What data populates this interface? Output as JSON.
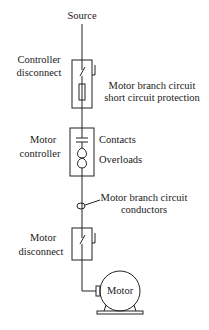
{
  "diagram": {
    "type": "single-line motor circuit diagram",
    "labels": {
      "source": "Source",
      "controller_disconnect_line1": "Controller",
      "controller_disconnect_line2": "disconnect",
      "short_circuit_line1": "Motor branch circuit",
      "short_circuit_line2": "short circuit protection",
      "motor_controller_line1": "Motor",
      "motor_controller_line2": "controller",
      "contacts": "Contacts",
      "overloads": "Overloads",
      "conductors_line1": "Motor branch circuit",
      "conductors_line2": "conductors",
      "motor_disconnect_line1": "Motor",
      "motor_disconnect_line2": "disconnect",
      "motor": "Motor"
    },
    "colors": {
      "line": "#222222",
      "background": "#ffffff"
    }
  }
}
